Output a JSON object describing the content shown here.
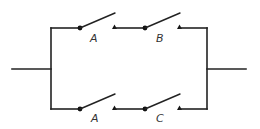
{
  "diagram": {
    "type": "parallel-series switch circuit",
    "branches": [
      {
        "position": "top",
        "switches": [
          {
            "label": "A",
            "state": "open"
          },
          {
            "label": "B",
            "state": "open"
          }
        ]
      },
      {
        "position": "bottom",
        "switches": [
          {
            "label": "A",
            "state": "open"
          },
          {
            "label": "C",
            "state": "open"
          }
        ]
      }
    ],
    "colors": {
      "line": "#222222",
      "label": "#333333",
      "background": "#ffffff"
    }
  }
}
